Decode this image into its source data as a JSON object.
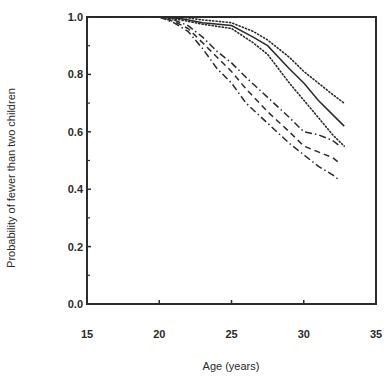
{
  "chart_data": {
    "type": "line",
    "title": "",
    "xlabel": "Age (years)",
    "ylabel": "Probability of fewer than two children",
    "xlim": [
      15,
      35
    ],
    "ylim": [
      0.0,
      1.0
    ],
    "x_ticks": [
      "15",
      "20",
      "25",
      "30",
      "35"
    ],
    "y_ticks": [
      "0.0",
      "0.2",
      "0.4",
      "0.6",
      "0.8",
      "1.0"
    ],
    "grid": false,
    "legend": null,
    "series": [
      {
        "name": "Upper group - upper bound",
        "style": "dotted",
        "x": [
          15,
          20,
          21.5,
          23,
          25,
          26.5,
          27.5,
          29,
          30,
          31,
          32,
          32.8
        ],
        "y": [
          1.0,
          1.0,
          1.0,
          0.99,
          0.98,
          0.95,
          0.92,
          0.86,
          0.81,
          0.77,
          0.73,
          0.7
        ]
      },
      {
        "name": "Upper group - estimate",
        "style": "solid",
        "x": [
          15,
          20,
          21.5,
          23,
          25,
          26.5,
          27.5,
          29,
          30,
          31,
          32,
          32.8
        ],
        "y": [
          1.0,
          1.0,
          0.995,
          0.98,
          0.97,
          0.93,
          0.9,
          0.82,
          0.77,
          0.71,
          0.66,
          0.62
        ]
      },
      {
        "name": "Upper group - lower bound",
        "style": "dotted",
        "x": [
          15,
          20,
          21.5,
          23,
          25,
          26.5,
          27.5,
          29,
          30,
          31,
          32,
          32.8
        ],
        "y": [
          1.0,
          1.0,
          0.99,
          0.975,
          0.96,
          0.91,
          0.87,
          0.77,
          0.71,
          0.65,
          0.59,
          0.55
        ]
      },
      {
        "name": "Lower group - upper bound",
        "style": "dash-dot",
        "x": [
          15,
          20,
          21,
          22,
          23,
          24,
          25,
          26,
          27.5,
          29,
          30,
          31,
          32,
          32.5
        ],
        "y": [
          1.0,
          1.0,
          0.99,
          0.97,
          0.93,
          0.88,
          0.84,
          0.79,
          0.72,
          0.65,
          0.6,
          0.59,
          0.57,
          0.55
        ]
      },
      {
        "name": "Lower group - estimate",
        "style": "dashed",
        "x": [
          15,
          20,
          21,
          22,
          23,
          24,
          25,
          26,
          27.5,
          29,
          30,
          31,
          32,
          32.5
        ],
        "y": [
          1.0,
          1.0,
          0.985,
          0.96,
          0.91,
          0.86,
          0.81,
          0.75,
          0.67,
          0.6,
          0.55,
          0.53,
          0.51,
          0.49
        ]
      },
      {
        "name": "Lower group - lower bound",
        "style": "dash-dot",
        "x": [
          15,
          20,
          21,
          22,
          23,
          24,
          25,
          26,
          27.5,
          29,
          30,
          31,
          32,
          32.5
        ],
        "y": [
          1.0,
          1.0,
          0.98,
          0.95,
          0.89,
          0.82,
          0.77,
          0.7,
          0.63,
          0.56,
          0.52,
          0.48,
          0.45,
          0.43
        ]
      }
    ]
  }
}
